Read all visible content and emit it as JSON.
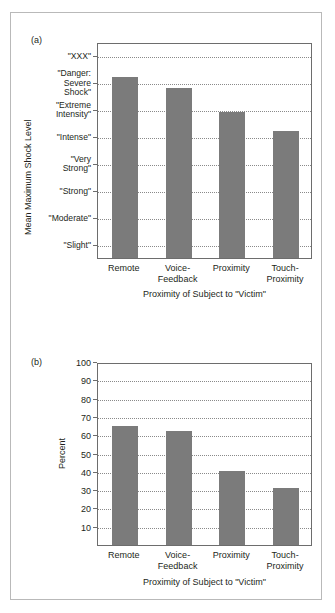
{
  "figure": {
    "panel_a_label": "(a)",
    "panel_b_label": "(b)"
  },
  "chart_data": [
    {
      "type": "bar",
      "panel": "(a)",
      "title": "",
      "xlabel": "Proximity of Subject to \"Victim\"",
      "ylabel": "Mean Maximum Shock Level",
      "categories": [
        "Remote",
        "Voice-\nFeedback",
        "Proximity",
        "Touch-\nProximity"
      ],
      "category_lines": [
        [
          "Remote"
        ],
        [
          "Voice-",
          "Feedback"
        ],
        [
          "Proximity"
        ],
        [
          "Touch-",
          "Proximity"
        ]
      ],
      "ytick_labels": [
        "\"XXX\"",
        "\"Danger:\nSevere\nShock\"",
        "\"Extreme\nIntensity\"",
        "\"Intense\"",
        "\"Very\nStrong\"",
        "\"Strong\"",
        "\"Moderate\"",
        "\"Slight\""
      ],
      "ytick_values": [
        8,
        7,
        6,
        5,
        4,
        3,
        2,
        1
      ],
      "ylim": [
        0.5,
        8.5
      ],
      "grid": true,
      "values": [
        7.2,
        6.8,
        5.9,
        5.2
      ],
      "bar_color": "#7b7b7b",
      "legend": "none"
    },
    {
      "type": "bar",
      "panel": "(b)",
      "title": "",
      "xlabel": "Proximity of Subject to \"Victim\"",
      "ylabel": "Percent",
      "categories": [
        "Remote",
        "Voice-\nFeedback",
        "Proximity",
        "Touch-\nProximity"
      ],
      "category_lines": [
        [
          "Remote"
        ],
        [
          "Voice-",
          "Feedback"
        ],
        [
          "Proximity"
        ],
        [
          "Touch-",
          "Proximity"
        ]
      ],
      "ytick_labels": [
        "100",
        "90",
        "80",
        "70",
        "60",
        "50",
        "40",
        "30",
        "20",
        "10"
      ],
      "ytick_values": [
        100,
        90,
        80,
        70,
        60,
        50,
        40,
        30,
        20,
        10
      ],
      "ylim": [
        0,
        100
      ],
      "grid": true,
      "values": [
        65,
        62.5,
        40.5,
        31
      ],
      "bar_color": "#7b7b7b",
      "legend": "none"
    }
  ]
}
